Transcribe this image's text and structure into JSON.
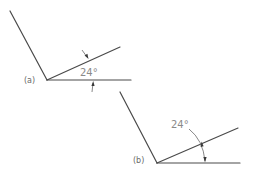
{
  "figure": {
    "panel_a": {
      "label": "(a)",
      "angle_label": "24°",
      "style": "external arrows pointing inward to the angle lines"
    },
    "panel_b": {
      "label": "(b)",
      "angle_label": "24°",
      "style": "curved arc dimension with leader to text outside the angle"
    }
  },
  "colors": {
    "line": "#4a4a4a",
    "text": "#8a8a8a",
    "background": "#ffffff"
  }
}
